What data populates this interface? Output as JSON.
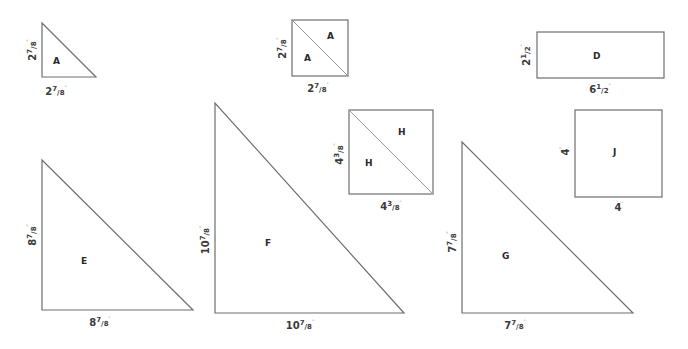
{
  "diagram": {
    "type": "quilt-cutting-templates",
    "stroke_color": "#6e6e6e",
    "text_color": "#2a2a2a",
    "pieces": [
      {
        "id": "A-triangle",
        "shape": "half-square-triangle",
        "labels": [
          "A"
        ],
        "height": {
          "whole": "2",
          "num": "7",
          "den": "8",
          "unit": "″"
        },
        "width": {
          "whole": "2",
          "num": "7",
          "den": "8",
          "unit": "″"
        }
      },
      {
        "id": "A-square",
        "shape": "square-split-diagonal",
        "labels": [
          "A",
          "A"
        ],
        "height": {
          "whole": "2",
          "num": "7",
          "den": "8",
          "unit": "″"
        },
        "width": {
          "whole": "2",
          "num": "7",
          "den": "8",
          "unit": "″"
        }
      },
      {
        "id": "D",
        "shape": "rectangle",
        "labels": [
          "D"
        ],
        "height": {
          "whole": "2",
          "num": "1",
          "den": "2",
          "unit": "″"
        },
        "width": {
          "whole": "6",
          "num": "1",
          "den": "2",
          "unit": "″"
        }
      },
      {
        "id": "E",
        "shape": "half-square-triangle",
        "labels": [
          "E"
        ],
        "height": {
          "whole": "8",
          "num": "7",
          "den": "8",
          "unit": "″"
        },
        "width": {
          "whole": "8",
          "num": "7",
          "den": "8",
          "unit": "″"
        }
      },
      {
        "id": "F",
        "shape": "half-square-triangle",
        "labels": [
          "F"
        ],
        "height": {
          "whole": "10",
          "num": "7",
          "den": "8",
          "unit": "″"
        },
        "width": {
          "whole": "10",
          "num": "7",
          "den": "8",
          "unit": "″"
        }
      },
      {
        "id": "H",
        "shape": "square-split-diagonal",
        "labels": [
          "H",
          "H"
        ],
        "height": {
          "whole": "4",
          "num": "3",
          "den": "8",
          "unit": "″"
        },
        "width": {
          "whole": "4",
          "num": "3",
          "den": "8",
          "unit": "″"
        }
      },
      {
        "id": "G",
        "shape": "half-square-triangle",
        "labels": [
          "G"
        ],
        "height": {
          "whole": "7",
          "num": "7",
          "den": "8",
          "unit": "″"
        },
        "width": {
          "whole": "7",
          "num": "7",
          "den": "8",
          "unit": "″"
        }
      },
      {
        "id": "J",
        "shape": "square",
        "labels": [
          "J"
        ],
        "height": {
          "whole": "4",
          "num": "",
          "den": "",
          "unit": "″"
        },
        "width": {
          "whole": "4",
          "num": "",
          "den": "",
          "unit": "″"
        }
      }
    ]
  }
}
